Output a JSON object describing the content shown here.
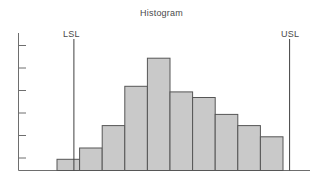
{
  "chart_data": {
    "type": "bar",
    "title": "Histogram",
    "xlabel": "",
    "ylabel": "",
    "grid": false,
    "legend": null,
    "categories": [
      "1",
      "2",
      "3",
      "4",
      "5",
      "6",
      "7",
      "8",
      "9",
      "10"
    ],
    "values": [
      1,
      2,
      4,
      7.5,
      10,
      7,
      6.5,
      5,
      4,
      3
    ],
    "ylim": [
      0,
      11
    ],
    "y_tick_count": 6,
    "y_tick_values": [
      2,
      4,
      6,
      8,
      10,
      11
    ],
    "bar_fill_color": "#c9c9c9",
    "bar_edge_color": "#565656",
    "axis_color": "#6e6e6e",
    "annotations": [
      {
        "name": "LSL",
        "label": "LSL",
        "type": "vline",
        "x_position": 0.19
      },
      {
        "name": "USL",
        "label": "USL",
        "type": "vline",
        "x_position": 0.93
      }
    ]
  },
  "labels": {
    "lsl": "LSL",
    "usl": "USL"
  }
}
